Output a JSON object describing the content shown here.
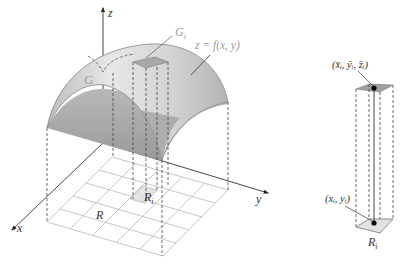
{
  "figure": {
    "colors": {
      "surface_fill": "#c8c8c8",
      "surface_fill_light": "#e6e6e6",
      "patch_fill": "#a9a9a9",
      "grid_line": "#b5b5b5",
      "axis_line": "#333333",
      "dashed_line": "#444444"
    }
  },
  "left_diagram": {
    "axes": {
      "z_label": "z",
      "x_label": "x",
      "y_label": "y"
    },
    "surface_label": "G",
    "patch_label": "G",
    "patch_label_sub": "i",
    "function_label": "z = f(x, y)",
    "region_label": "R",
    "subregion_label": "R",
    "subregion_label_sub": "i"
  },
  "right_diagram": {
    "top_point_label": "(x̄ᵢ, ȳᵢ, z̄ᵢ)",
    "bottom_point_label": "(xᵢ, yᵢ)",
    "base_label": "R",
    "base_label_sub": "i"
  }
}
